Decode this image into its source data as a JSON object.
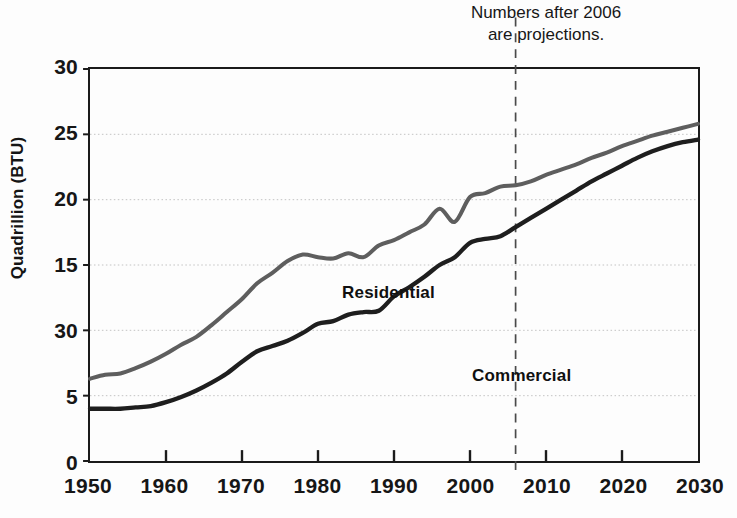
{
  "figure": {
    "width": 737,
    "height": 518,
    "background_color": "#fdfdfd"
  },
  "annotation": {
    "projection_note": "Numbers after 2006\nare projections.",
    "projection_year": 2006
  },
  "axes": {
    "y_title": "Quadrillion (BTU)",
    "x_title": "",
    "y_tick_labels": [
      "30",
      "25",
      "20",
      "15",
      "30",
      "5",
      "0"
    ],
    "y_tick_values": [
      30,
      25,
      20,
      15,
      10,
      5,
      0
    ],
    "x_tick_labels": [
      "1950",
      "1960",
      "1970",
      "1980",
      "1990",
      "2000",
      "2010",
      "2020",
      "2030"
    ],
    "x_tick_values": [
      1950,
      1960,
      1970,
      1980,
      1990,
      2000,
      2010,
      2020,
      2030
    ]
  },
  "style": {
    "frame_color": "#1b1b1b",
    "gridline_color": "#b9b9b9",
    "residential_color": "#5e5e5e",
    "commercial_color": "#1e1e1e",
    "projection_line_color": "#4a4a4a"
  },
  "chart_data": {
    "type": "line",
    "title": "",
    "subtitle": "",
    "xlabel": "",
    "ylabel": "Quadrillion (BTU)",
    "xlim": [
      1950,
      2030
    ],
    "ylim": [
      0,
      30
    ],
    "grid": true,
    "legend_position": "inline-annotation",
    "annotations": [
      {
        "text": "Numbers after 2006 are projections.",
        "x": 2006,
        "type": "vertical-dashed-line-with-caption"
      }
    ],
    "x": [
      1950,
      1952,
      1954,
      1956,
      1958,
      1960,
      1962,
      1964,
      1966,
      1968,
      1970,
      1972,
      1974,
      1976,
      1978,
      1980,
      1982,
      1984,
      1986,
      1988,
      1990,
      1992,
      1994,
      1996,
      1998,
      2000,
      2002,
      2004,
      2006,
      2008,
      2010,
      2012,
      2014,
      2016,
      2018,
      2020,
      2022,
      2024,
      2026,
      2028,
      2030
    ],
    "series": [
      {
        "name": "Residential",
        "color": "#5e5e5e",
        "values": [
          6.3,
          6.6,
          6.7,
          7.1,
          7.6,
          8.2,
          8.9,
          9.5,
          10.4,
          11.4,
          12.4,
          13.6,
          14.4,
          15.3,
          15.8,
          15.6,
          15.5,
          15.9,
          15.6,
          16.5,
          16.9,
          17.5,
          18.1,
          19.3,
          18.3,
          20.2,
          20.5,
          21.0,
          21.1,
          21.4,
          21.9,
          22.3,
          22.7,
          23.2,
          23.6,
          24.1,
          24.5,
          24.9,
          25.2,
          25.5,
          25.8
        ]
      },
      {
        "name": "Commercial",
        "color": "#1e1e1e",
        "values": [
          4.0,
          4.0,
          4.0,
          4.1,
          4.2,
          4.5,
          4.9,
          5.4,
          6.0,
          6.7,
          7.6,
          8.4,
          8.8,
          9.2,
          9.8,
          10.5,
          10.7,
          11.2,
          11.4,
          11.5,
          12.6,
          13.3,
          14.1,
          15.0,
          15.6,
          16.7,
          17.0,
          17.2,
          17.9,
          18.6,
          19.3,
          20.0,
          20.7,
          21.4,
          22.0,
          22.6,
          23.2,
          23.7,
          24.1,
          24.4,
          24.6
        ]
      }
    ]
  }
}
